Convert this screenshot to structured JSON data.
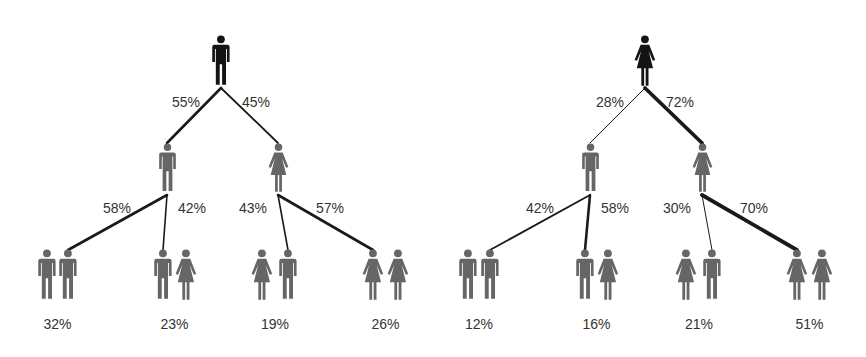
{
  "colors": {
    "root": "#141414",
    "child": "#666666",
    "line": "#1a1a1a",
    "text": "#333333"
  },
  "trees": [
    {
      "name": "father-tree",
      "root": {
        "gender": "male",
        "icon": "man-icon",
        "x": 221
      },
      "branches": [
        {
          "label": "55%",
          "child": {
            "gender": "male",
            "icon": "man-icon",
            "x": 167
          },
          "weight": 2.6,
          "sub": [
            {
              "label": "58%",
              "pair": [
                "male",
                "male"
              ],
              "x": [
                47,
                68
              ],
              "weight": 2.6,
              "result": "32%"
            },
            {
              "label": "42%",
              "pair": [
                "male",
                "female"
              ],
              "x": [
                163,
                186
              ],
              "weight": 1.6,
              "result": "23%"
            }
          ]
        },
        {
          "label": "45%",
          "child": {
            "gender": "female",
            "icon": "woman-icon",
            "x": 278
          },
          "weight": 1.8,
          "sub": [
            {
              "label": "43%",
              "pair": [
                "female",
                "male"
              ],
              "x": [
                262,
                288
              ],
              "weight": 1.6,
              "result": "19%"
            },
            {
              "label": "57%",
              "pair": [
                "female",
                "female"
              ],
              "x": [
                373,
                398
              ],
              "weight": 2.6,
              "result": "26%"
            }
          ]
        }
      ]
    },
    {
      "name": "mother-tree",
      "root": {
        "gender": "female",
        "icon": "woman-icon",
        "x": 645
      },
      "branches": [
        {
          "label": "28%",
          "child": {
            "gender": "male",
            "icon": "man-icon",
            "x": 590
          },
          "weight": 1.0,
          "sub": [
            {
              "label": "42%",
              "pair": [
                "male",
                "male"
              ],
              "x": [
                468,
                490
              ],
              "weight": 1.8,
              "result": "12%"
            },
            {
              "label": "58%",
              "pair": [
                "male",
                "female"
              ],
              "x": [
                585,
                608
              ],
              "weight": 2.6,
              "result": "16%"
            }
          ]
        },
        {
          "label": "72%",
          "child": {
            "gender": "female",
            "icon": "woman-icon",
            "x": 702
          },
          "weight": 3.8,
          "sub": [
            {
              "label": "30%",
              "pair": [
                "female",
                "male"
              ],
              "x": [
                686,
                712
              ],
              "weight": 1.0,
              "result": "21%"
            },
            {
              "label": "70%",
              "pair": [
                "female",
                "female"
              ],
              "x": [
                797,
                822
              ],
              "weight": 3.8,
              "result": "51%"
            }
          ]
        }
      ]
    }
  ]
}
